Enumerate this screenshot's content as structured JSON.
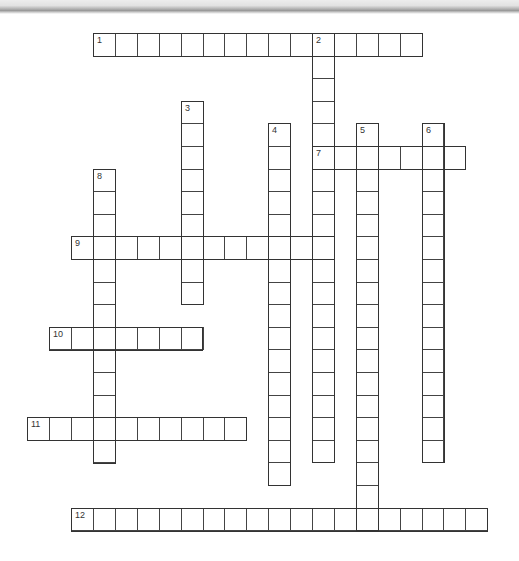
{
  "puzzle": {
    "type": "crossword",
    "grid": {
      "origin_x": 93,
      "origin_y": 33,
      "cell_w": 21.9,
      "cell_h": 22.6
    },
    "entries": [
      {
        "number": "1",
        "direction": "across",
        "row": 0,
        "col": 0,
        "length": 15
      },
      {
        "number": "2",
        "direction": "down",
        "row": 0,
        "col": 10,
        "length": 19
      },
      {
        "number": "3",
        "direction": "down",
        "row": 3,
        "col": 4,
        "length": 9
      },
      {
        "number": "4",
        "direction": "down",
        "row": 4,
        "col": 8,
        "length": 16
      },
      {
        "number": "5",
        "direction": "down",
        "row": 4,
        "col": 12,
        "length": 18
      },
      {
        "number": "6",
        "direction": "down",
        "row": 4,
        "col": 15,
        "length": 15
      },
      {
        "number": "7",
        "direction": "across",
        "row": 5,
        "col": 10,
        "length": 7
      },
      {
        "number": "8",
        "direction": "down",
        "row": 6,
        "col": 0,
        "length": 13
      },
      {
        "number": "9",
        "direction": "across",
        "row": 9,
        "col": -1,
        "length": 12
      },
      {
        "number": "10",
        "direction": "across",
        "row": 13,
        "col": -2,
        "length": 7
      },
      {
        "number": "11",
        "direction": "across",
        "row": 17,
        "col": -3,
        "length": 10
      },
      {
        "number": "12",
        "direction": "across",
        "row": 21,
        "col": -1,
        "length": 19
      }
    ]
  }
}
